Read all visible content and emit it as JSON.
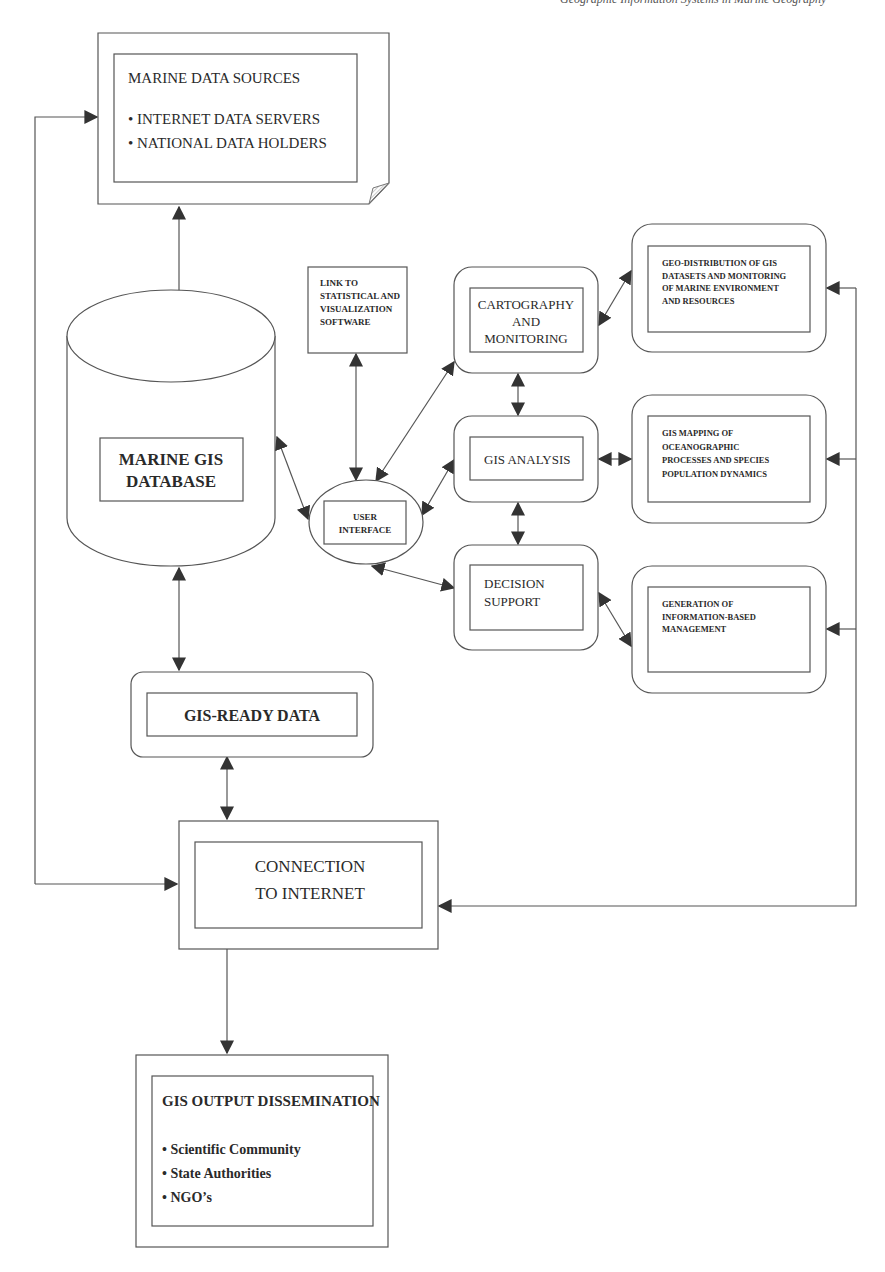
{
  "header": {
    "running_title": "Geographic Information Systems in Marine Geography"
  },
  "colors": {
    "line": "#555555",
    "arrow": "#333333",
    "text": "#2a2a2a",
    "background": "#ffffff",
    "fold": "#bbbbbb"
  },
  "nodes": {
    "marine_data_sources": {
      "title": "MARINE DATA SOURCES",
      "bullets": [
        "• INTERNET DATA SERVERS",
        "• NATIONAL DATA HOLDERS"
      ]
    },
    "marine_gis_database": {
      "lines": [
        "MARINE GIS",
        "DATABASE"
      ]
    },
    "link_software": {
      "lines": [
        "LINK TO",
        "STATISTICAL AND",
        "VISUALIZATION",
        "SOFTWARE"
      ]
    },
    "user_interface": {
      "lines": [
        "USER",
        "INTERFACE"
      ]
    },
    "cartography": {
      "lines": [
        "CARTOGRAPHY",
        "AND",
        "MONITORING"
      ]
    },
    "gis_analysis": {
      "lines": [
        "GIS ANALYSIS"
      ]
    },
    "decision_support": {
      "lines": [
        "DECISION",
        "SUPPORT"
      ]
    },
    "geo_distribution": {
      "lines": [
        "GEO-DISTRIBUTION OF GIS",
        "DATASETS AND MONITORING",
        "OF MARINE ENVIRONMENT",
        "AND RESOURCES"
      ]
    },
    "gis_mapping": {
      "lines": [
        "GIS MAPPING OF",
        "OCEANOGRAPHIC",
        "PROCESSES AND SPECIES",
        "POPULATION DYNAMICS"
      ]
    },
    "generation": {
      "lines": [
        "GENERATION OF",
        "INFORMATION-BASED",
        "MANAGEMENT"
      ]
    },
    "gis_ready_data": {
      "lines": [
        "GIS-READY DATA"
      ]
    },
    "connection_internet": {
      "lines": [
        "CONNECTION",
        "TO INTERNET"
      ]
    },
    "gis_output": {
      "title": "GIS OUTPUT DISSEMINATION",
      "bullets": [
        "• Scientific Community",
        "• State Authorities",
        "• NGO’s"
      ]
    }
  },
  "edges": [
    {
      "from": "marine_data_sources",
      "to": "marine_gis_database",
      "type": "bidirectional"
    },
    {
      "from": "marine_gis_database",
      "to": "user_interface",
      "type": "bidirectional"
    },
    {
      "from": "marine_gis_database",
      "to": "gis_ready_data",
      "type": "bidirectional"
    },
    {
      "from": "link_software",
      "to": "user_interface",
      "type": "bidirectional"
    },
    {
      "from": "user_interface",
      "to": "cartography",
      "type": "bidirectional"
    },
    {
      "from": "user_interface",
      "to": "gis_analysis",
      "type": "bidirectional"
    },
    {
      "from": "user_interface",
      "to": "decision_support",
      "type": "bidirectional"
    },
    {
      "from": "cartography",
      "to": "gis_analysis",
      "type": "bidirectional"
    },
    {
      "from": "gis_analysis",
      "to": "decision_support",
      "type": "bidirectional"
    },
    {
      "from": "cartography",
      "to": "geo_distribution",
      "type": "bidirectional"
    },
    {
      "from": "gis_analysis",
      "to": "gis_mapping",
      "type": "bidirectional"
    },
    {
      "from": "decision_support",
      "to": "generation",
      "type": "bidirectional"
    },
    {
      "from": "gis_ready_data",
      "to": "connection_internet",
      "type": "bidirectional"
    },
    {
      "from": "connection_internet",
      "to": "marine_data_sources",
      "type": "feedback-left"
    },
    {
      "from": "connection_internet",
      "to": "geo_distribution",
      "type": "feedback-right"
    },
    {
      "from": "connection_internet",
      "to": "gis_mapping",
      "type": "feedback-right"
    },
    {
      "from": "connection_internet",
      "to": "generation",
      "type": "feedback-right"
    },
    {
      "from": "connection_internet",
      "to": "gis_output",
      "type": "directed"
    }
  ]
}
